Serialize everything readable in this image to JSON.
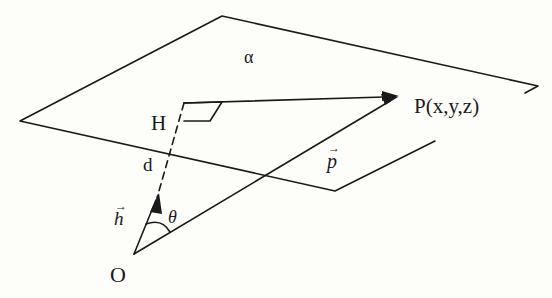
{
  "diagram": {
    "type": "geometry-figure",
    "labels": {
      "plane": "α",
      "foot": "H",
      "point": "P(x,y,z)",
      "distance": "d",
      "position_vector": "p",
      "normal_vector": "h",
      "angle": "θ",
      "origin": "O",
      "vector_arrow": "→"
    },
    "colors": {
      "line": "#1a1a1a",
      "background": "#fdfdfa"
    }
  }
}
